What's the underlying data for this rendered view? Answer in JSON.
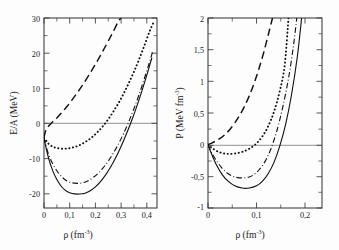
{
  "figure": {
    "background_color": "#fdfdfd",
    "curve_color": "#111111",
    "axis_color": "#3a3a3a",
    "zero_line_color": "#7d7d7d"
  },
  "chart_data": [
    {
      "type": "line",
      "panel": "left",
      "title": "",
      "xlabel": "ρ (fm",
      "xlabel_sup": "-3",
      "xlabel_tail": ")",
      "ylabel": "E/A (MeV)",
      "xlim": [
        0,
        0.44
      ],
      "ylim": [
        -20,
        34
      ],
      "xticks": [
        0,
        0.1,
        0.2,
        0.3,
        0.4
      ],
      "xticklabels": [
        "0",
        "0,1",
        "0,2",
        "0,3",
        "0,4"
      ],
      "yticks": [
        -20,
        -10,
        0,
        10,
        20,
        30
      ],
      "yticklabels": [
        "-20",
        "-10",
        "0",
        "10",
        "20",
        "30"
      ],
      "grid": false,
      "legend": "none",
      "zero_line": true,
      "series": [
        {
          "name": "dashed",
          "style": "dashed",
          "x": [
            0,
            0.005,
            0.012,
            0.022,
            0.035,
            0.05,
            0.07,
            0.09,
            0.11,
            0.13,
            0.15,
            0.17,
            0.19,
            0.21,
            0.23,
            0.25,
            0.27,
            0.29,
            0.3
          ],
          "y": [
            0,
            1.6,
            2.7,
            3.6,
            4.6,
            5.6,
            7.2,
            8.9,
            10.8,
            12.8,
            14.9,
            17.2,
            19.6,
            22.1,
            24.7,
            27.4,
            30.2,
            33.1,
            34.0
          ]
        },
        {
          "name": "dotted",
          "style": "dotted",
          "x": [
            0,
            0.008,
            0.02,
            0.035,
            0.05,
            0.07,
            0.09,
            0.11,
            0.13,
            0.15,
            0.17,
            0.19,
            0.21,
            0.23,
            0.25,
            0.27,
            0.29,
            0.31,
            0.33,
            0.35,
            0.37,
            0.39,
            0.41,
            0.425
          ],
          "y": [
            0,
            -0.9,
            -1.9,
            -2.6,
            -2.95,
            -3.15,
            -3.1,
            -2.85,
            -2.4,
            -1.7,
            -0.8,
            0.3,
            1.7,
            3.3,
            5.2,
            7.4,
            9.8,
            12.5,
            15.5,
            18.7,
            22.2,
            26.0,
            30.0,
            32.5
          ]
        },
        {
          "name": "dash-dot",
          "style": "dashdot",
          "x": [
            0,
            0.008,
            0.02,
            0.035,
            0.05,
            0.07,
            0.09,
            0.11,
            0.13,
            0.15,
            0.17,
            0.19,
            0.21,
            0.23,
            0.25,
            0.27,
            0.29,
            0.31,
            0.33,
            0.35,
            0.37,
            0.39,
            0.41,
            0.425
          ],
          "y": [
            0,
            -2.4,
            -5.2,
            -7.6,
            -9.4,
            -11.2,
            -12.3,
            -12.85,
            -13.0,
            -12.85,
            -12.3,
            -11.4,
            -10.2,
            -8.6,
            -6.7,
            -4.4,
            -1.8,
            1.2,
            4.5,
            8.2,
            12.2,
            16.6,
            21.3,
            24.9
          ]
        },
        {
          "name": "solid",
          "style": "solid",
          "x": [
            0,
            0.008,
            0.02,
            0.035,
            0.05,
            0.07,
            0.09,
            0.11,
            0.13,
            0.15,
            0.16,
            0.18,
            0.2,
            0.22,
            0.24,
            0.26,
            0.28,
            0.3,
            0.32,
            0.34,
            0.36,
            0.38,
            0.4,
            0.42
          ],
          "y": [
            0,
            -2.9,
            -6.4,
            -9.6,
            -11.9,
            -14.1,
            -15.3,
            -15.9,
            -16.05,
            -15.95,
            -15.8,
            -15.1,
            -14.0,
            -12.5,
            -10.6,
            -8.3,
            -5.6,
            -2.5,
            0.9,
            4.6,
            8.6,
            13.0,
            17.7,
            22.7
          ]
        }
      ]
    },
    {
      "type": "line",
      "panel": "right",
      "title": "",
      "xlabel": "ρ (fm",
      "xlabel_sup": "-3",
      "xlabel_tail": ")",
      "ylabel": "P (MeV fm",
      "ylabel_sup": "-3",
      "ylabel_tail": ")",
      "xlim": [
        0,
        0.235
      ],
      "ylim": [
        -1,
        2
      ],
      "xticks": [
        0,
        0.1,
        0.2
      ],
      "xticklabels": [
        "0",
        "0,1",
        "0,2"
      ],
      "yticks": [
        -1,
        -0.5,
        0,
        0.5,
        1,
        1.5,
        2
      ],
      "yticklabels": [
        "-1",
        "-0,5",
        "0",
        "0,5",
        "1",
        "1,5",
        "2"
      ],
      "grid": false,
      "legend": "none",
      "zero_line": true,
      "series": [
        {
          "name": "dashed",
          "style": "dashed",
          "x": [
            0,
            0.006,
            0.014,
            0.025,
            0.035,
            0.045,
            0.055,
            0.065,
            0.075,
            0.085,
            0.095,
            0.105,
            0.115,
            0.125,
            0.133
          ],
          "y": [
            0,
            0.02,
            0.05,
            0.1,
            0.16,
            0.24,
            0.34,
            0.46,
            0.6,
            0.77,
            0.97,
            1.2,
            1.46,
            1.76,
            2.0
          ]
        },
        {
          "name": "dotted",
          "style": "dotted",
          "x": [
            0,
            0.008,
            0.018,
            0.03,
            0.042,
            0.055,
            0.07,
            0.085,
            0.1,
            0.112,
            0.124,
            0.136,
            0.148,
            0.158,
            0.166
          ],
          "y": [
            0,
            -0.05,
            -0.1,
            -0.135,
            -0.145,
            -0.14,
            -0.115,
            -0.065,
            0.02,
            0.13,
            0.29,
            0.52,
            0.85,
            1.25,
            2.0
          ]
        },
        {
          "name": "dash-dot",
          "style": "dashdot",
          "x": [
            0,
            0.008,
            0.018,
            0.03,
            0.042,
            0.055,
            0.07,
            0.085,
            0.095,
            0.105,
            0.118,
            0.13,
            0.142,
            0.154,
            0.166,
            0.176,
            0.183
          ],
          "y": [
            0,
            -0.13,
            -0.26,
            -0.38,
            -0.46,
            -0.51,
            -0.525,
            -0.51,
            -0.47,
            -0.4,
            -0.26,
            -0.06,
            0.22,
            0.59,
            1.05,
            1.55,
            2.0
          ]
        },
        {
          "name": "solid",
          "style": "solid",
          "x": [
            0,
            0.008,
            0.018,
            0.03,
            0.042,
            0.055,
            0.07,
            0.085,
            0.1,
            0.112,
            0.124,
            0.136,
            0.148,
            0.16,
            0.172,
            0.184,
            0.193
          ],
          "y": [
            0,
            -0.16,
            -0.33,
            -0.48,
            -0.58,
            -0.65,
            -0.685,
            -0.685,
            -0.65,
            -0.58,
            -0.46,
            -0.28,
            -0.02,
            0.32,
            0.78,
            1.38,
            2.0
          ]
        }
      ]
    }
  ]
}
